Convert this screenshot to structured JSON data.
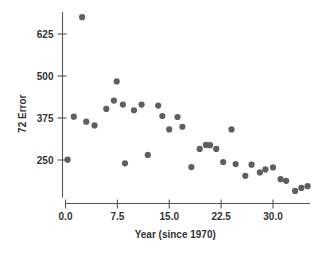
{
  "chart_data": {
    "type": "scatter",
    "title": "",
    "xlabel": "Year (since 1970)",
    "ylabel": "72 Error",
    "xlim": [
      -1.5,
      36.0
    ],
    "ylim": [
      130,
      700
    ],
    "grid": false,
    "legend": null,
    "point_color": "#5f5f5f",
    "xticks": [
      "0.0",
      "7.5",
      "15.0",
      "22.5",
      "30.0"
    ],
    "xtick_values": [
      0.0,
      7.5,
      15.0,
      22.5,
      30.0
    ],
    "yticks": [
      "250",
      "375",
      "500",
      "625"
    ],
    "ytick_values": [
      250,
      375,
      500,
      625
    ],
    "series": [
      {
        "name": "72 Error",
        "points": [
          [
            0.3,
            251
          ],
          [
            1.2,
            379
          ],
          [
            2.4,
            675
          ],
          [
            3.0,
            364
          ],
          [
            4.2,
            353
          ],
          [
            5.9,
            402
          ],
          [
            7.0,
            427
          ],
          [
            7.4,
            484
          ],
          [
            8.3,
            415
          ],
          [
            8.6,
            240
          ],
          [
            9.9,
            398
          ],
          [
            11.0,
            415
          ],
          [
            11.9,
            265
          ],
          [
            13.4,
            412
          ],
          [
            14.0,
            381
          ],
          [
            15.0,
            341
          ],
          [
            16.2,
            378
          ],
          [
            16.9,
            349
          ],
          [
            18.2,
            229
          ],
          [
            19.4,
            283
          ],
          [
            20.3,
            295
          ],
          [
            20.9,
            294
          ],
          [
            21.8,
            283
          ],
          [
            22.8,
            244
          ],
          [
            24.0,
            341
          ],
          [
            24.6,
            238
          ],
          [
            26.0,
            203
          ],
          [
            26.9,
            236
          ],
          [
            28.1,
            213
          ],
          [
            28.9,
            222
          ],
          [
            30.0,
            228
          ],
          [
            31.1,
            193
          ],
          [
            31.9,
            188
          ],
          [
            33.2,
            158
          ],
          [
            34.1,
            167
          ],
          [
            35.0,
            172
          ]
        ]
      }
    ]
  }
}
